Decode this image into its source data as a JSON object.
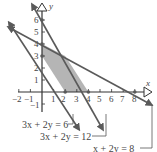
{
  "diagram": {
    "type": "linear-inequalities-feasible-region",
    "axes": {
      "x_label": "x",
      "y_label": "y",
      "x_ticks": [
        "−2",
        "−1",
        "1",
        "2",
        "3",
        "4",
        "5",
        "6",
        "7",
        "8"
      ],
      "y_ticks": [
        "−1",
        "1",
        "2",
        "3",
        "4",
        "5",
        "6"
      ]
    },
    "lines": [
      {
        "equation": "3x + 2y = 6",
        "x_intercept": 2,
        "y_intercept": 3
      },
      {
        "equation": "3x + 2y = 12",
        "x_intercept": 4,
        "y_intercept": 6
      },
      {
        "equation": "x + 2y = 8",
        "x_intercept": 8,
        "y_intercept": 4
      }
    ],
    "feasible_region_vertices": [
      [
        0,
        3
      ],
      [
        0,
        4
      ],
      [
        2,
        3
      ],
      [
        4,
        0
      ],
      [
        2,
        0
      ]
    ],
    "labels": {
      "line1": "3x + 2y = 6",
      "line2": "3x + 2y = 12",
      "line3": "x + 2y = 8"
    },
    "colors": {
      "region_fill": "#b5b5b5",
      "line_color": "#5a5a5a",
      "axis_color": "#333333"
    }
  }
}
